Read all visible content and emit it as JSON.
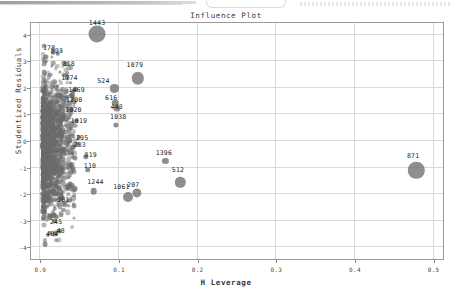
{
  "chart_data": {
    "type": "scatter",
    "title": "Influence Plot",
    "xlabel": "H Leverage",
    "ylabel": "Studentized Residuals",
    "xlim": [
      -0.012,
      0.512
    ],
    "ylim": [
      -4.45,
      4.45
    ],
    "grid": true,
    "legend": null,
    "xticks": [
      "0.0",
      "0.1",
      "0.2",
      "0.3",
      "0.4",
      "0.5"
    ],
    "xtick_values": [
      0.0,
      0.1,
      0.2,
      0.3,
      0.4,
      0.5
    ],
    "yticks": [
      "4",
      "3",
      "2",
      "1",
      "0",
      "-1",
      "-2",
      "-3",
      "-4"
    ],
    "ytick_values": [
      4,
      3,
      2,
      1,
      0,
      -1,
      -2,
      -3,
      -4
    ],
    "marker_note": "bubble area proportional to Cook's distance",
    "labeled_points": [
      {
        "label": "1443",
        "x": 0.072,
        "y": 4.02,
        "r": 8.5,
        "lx": 0.072,
        "ly": 4.46
      },
      {
        "label": "1079",
        "x": 0.124,
        "y": 2.36,
        "r": 6.2,
        "lx": 0.12,
        "ly": 2.86
      },
      {
        "label": "871",
        "x": 0.478,
        "y": -1.1,
        "r": 8.2,
        "lx": 0.474,
        "ly": -0.56
      },
      {
        "label": "524",
        "x": 0.094,
        "y": 1.98,
        "r": 4.1,
        "lx": 0.08,
        "ly": 2.25
      },
      {
        "label": "616",
        "x": 0.095,
        "y": 1.45,
        "r": 3.3,
        "lx": 0.09,
        "ly": 1.64
      },
      {
        "label": "443",
        "x": 0.097,
        "y": 1.25,
        "r": 3.6,
        "lx": 0.097,
        "ly": 1.3
      },
      {
        "label": "1038",
        "x": 0.096,
        "y": 0.6,
        "r": 2.6,
        "lx": 0.099,
        "ly": 0.9
      },
      {
        "label": "1396",
        "x": 0.159,
        "y": -0.76,
        "r": 3.1,
        "lx": 0.157,
        "ly": -0.44
      },
      {
        "label": "512",
        "x": 0.178,
        "y": -1.56,
        "r": 5.2,
        "lx": 0.175,
        "ly": -1.11
      },
      {
        "label": "1061",
        "x": 0.112,
        "y": -2.12,
        "r": 5.0,
        "lx": 0.103,
        "ly": -1.75
      },
      {
        "label": "207",
        "x": 0.123,
        "y": -1.97,
        "r": 4.6,
        "lx": 0.118,
        "ly": -1.66
      },
      {
        "label": "1244",
        "x": 0.068,
        "y": -1.89,
        "r": 3.3,
        "lx": 0.07,
        "ly": -1.55
      },
      {
        "label": "110",
        "x": 0.06,
        "y": -1.09,
        "r": 2.8,
        "lx": 0.063,
        "ly": -0.95
      },
      {
        "label": "819",
        "x": 0.058,
        "y": -0.6,
        "r": 2.7,
        "lx": 0.064,
        "ly": -0.51
      },
      {
        "label": "178",
        "x": 0.016,
        "y": 3.35,
        "r": 2.3,
        "lx": 0.011,
        "ly": 3.5
      },
      {
        "label": "593",
        "x": 0.022,
        "y": 3.29,
        "r": 2.3,
        "lx": 0.021,
        "ly": 3.4
      },
      {
        "label": "818",
        "x": 0.033,
        "y": 2.9,
        "r": 2.4,
        "lx": 0.036,
        "ly": 2.92
      },
      {
        "label": "1774",
        "x": 0.034,
        "y": 2.38,
        "r": 2.4,
        "lx": 0.037,
        "ly": 2.38
      },
      {
        "label": "1469",
        "x": 0.044,
        "y": 1.95,
        "r": 2.3,
        "lx": 0.046,
        "ly": 1.93
      },
      {
        "label": "1200",
        "x": 0.041,
        "y": 1.58,
        "r": 2.3,
        "lx": 0.043,
        "ly": 1.56
      },
      {
        "label": "1020",
        "x": 0.04,
        "y": 1.19,
        "r": 2.3,
        "lx": 0.042,
        "ly": 1.17
      },
      {
        "label": "1019",
        "x": 0.046,
        "y": 0.76,
        "r": 2.2,
        "lx": 0.049,
        "ly": 0.74
      },
      {
        "label": "295",
        "x": 0.049,
        "y": 0.14,
        "r": 2.2,
        "lx": 0.053,
        "ly": 0.13
      },
      {
        "label": "283",
        "x": 0.047,
        "y": -0.13,
        "r": 2.2,
        "lx": 0.05,
        "ly": -0.16
      },
      {
        "label": "901",
        "x": 0.026,
        "y": -2.2,
        "r": 2.4,
        "lx": 0.029,
        "ly": -2.22
      },
      {
        "label": "245",
        "x": 0.018,
        "y": -3.02,
        "r": 2.4,
        "lx": 0.02,
        "ly": -3.05
      },
      {
        "label": "48",
        "x": 0.024,
        "y": -3.4,
        "r": 2.4,
        "lx": 0.026,
        "ly": -3.38
      },
      {
        "label": "404",
        "x": 0.018,
        "y": -3.52,
        "r": 2.5,
        "lx": 0.015,
        "ly": -3.52
      }
    ],
    "cluster_description": "dense unlabeled mass of points along low leverage (x < 0.03) spanning residuals -4 to 3.5"
  }
}
